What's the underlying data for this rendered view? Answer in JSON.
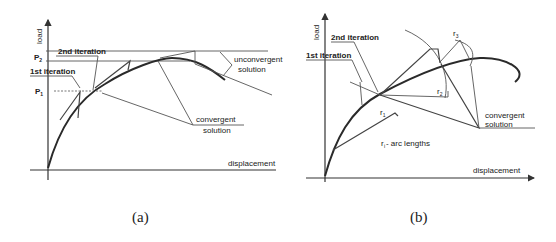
{
  "figure_a": {
    "y_axis_label": "load",
    "x_axis_label": "displacement",
    "p_labels": {
      "p2": "P",
      "p2_sub": "2",
      "p1": "P",
      "p1_sub": "1"
    },
    "annotations": {
      "iter1": "1st iteration",
      "iter2": "2nd iteration",
      "unconvergent_1": "unconvergent",
      "unconvergent_2": "solution",
      "convergent_1": "convergent",
      "convergent_2": "solution"
    },
    "caption": "(a)"
  },
  "figure_b": {
    "y_axis_label": "load",
    "x_axis_label": "displacement",
    "annotations": {
      "iter1": "1st iteration",
      "iter2": "2nd iteration",
      "convergent_1": "convergent",
      "convergent_2": "solution",
      "arc_lengths": "r - arc lengths",
      "arc_lengths_sub": "i",
      "r1": "r",
      "r1_sub": "1",
      "r2": "r",
      "r2_sub": "2",
      "r3": "r",
      "r3_sub": "3"
    },
    "caption": "(b)"
  }
}
